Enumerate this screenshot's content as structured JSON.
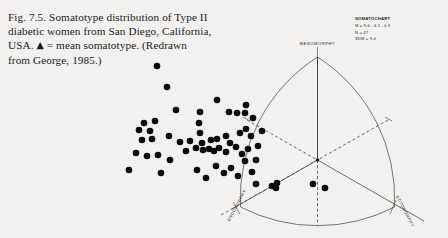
{
  "figure": {
    "caption_lines": [
      "Fig. 7.5. Somatotype distribution of Type II",
      "diabetic women from San Diego, California,",
      "USA. ▲ = mean somatotype. (Redrawn",
      "from George, 1985.)"
    ],
    "caption_full": "Fig. 7.5. Somatotype distribution of Type II diabetic women from San Diego, California, USA. ▲ = mean somatotype. (Redrawn from George, 1985.)",
    "figure_number": "Fig. 7.5.",
    "mean_marker_glyph": "▲",
    "background_color": "#f2f1ef",
    "ink_color": "#0b0b0b"
  },
  "legend": {
    "title": "SOMATOCHART",
    "lines": [
      "M = 9.6 - 6.1 - 0.9",
      "N = 47",
      "SDM = 9.0"
    ],
    "mean_somatotype": "9.6 - 6.1 - 0.9",
    "sample_size": "47",
    "sdm": "9.0"
  },
  "axes": {
    "top": "MESOMORPHY",
    "bottom_left": "ENDOMORPHY",
    "bottom_right": "ECTOMORPHY"
  },
  "chart_data": {
    "type": "scatter",
    "title": "Somatotype distribution of Type II diabetic women from San Diego, California, USA",
    "xlabel": "",
    "ylabel": "",
    "legend_position": "top-right",
    "grid": false,
    "axis_labels": [
      "ENDOMORPHY",
      "MESOMORPHY",
      "ECTOMORPHY"
    ],
    "n_points_drawn": 62,
    "mean_point": {
      "x": 317.5,
      "y": 160.0,
      "label": "mean somatotype"
    },
    "triangle": {
      "apex": {
        "x": 317.5,
        "y": 57.0
      },
      "left_corner": {
        "x": 240.0,
        "y": 207.0
      },
      "right_corner": {
        "x": 411.0,
        "y": 207.0
      },
      "center": {
        "x": 317.5,
        "y": 160.0
      }
    },
    "points": [
      {
        "x": 157,
        "y": 66
      },
      {
        "x": 167,
        "y": 87
      },
      {
        "x": 176,
        "y": 110
      },
      {
        "x": 200,
        "y": 112
      },
      {
        "x": 217,
        "y": 100
      },
      {
        "x": 229,
        "y": 112
      },
      {
        "x": 237,
        "y": 113
      },
      {
        "x": 246,
        "y": 105
      },
      {
        "x": 253,
        "y": 118
      },
      {
        "x": 155,
        "y": 121
      },
      {
        "x": 144,
        "y": 123
      },
      {
        "x": 139,
        "y": 130
      },
      {
        "x": 150,
        "y": 131
      },
      {
        "x": 152,
        "y": 139
      },
      {
        "x": 142,
        "y": 140
      },
      {
        "x": 169,
        "y": 136
      },
      {
        "x": 180,
        "y": 142
      },
      {
        "x": 190,
        "y": 141
      },
      {
        "x": 199,
        "y": 123
      },
      {
        "x": 200,
        "y": 133
      },
      {
        "x": 202,
        "y": 143
      },
      {
        "x": 211,
        "y": 140
      },
      {
        "x": 217,
        "y": 139
      },
      {
        "x": 226,
        "y": 136
      },
      {
        "x": 230,
        "y": 143
      },
      {
        "x": 240,
        "y": 133
      },
      {
        "x": 246,
        "y": 129
      },
      {
        "x": 251,
        "y": 136
      },
      {
        "x": 136,
        "y": 153
      },
      {
        "x": 147,
        "y": 156
      },
      {
        "x": 158,
        "y": 155
      },
      {
        "x": 170,
        "y": 160
      },
      {
        "x": 186,
        "y": 151
      },
      {
        "x": 196,
        "y": 148
      },
      {
        "x": 203,
        "y": 150
      },
      {
        "x": 209,
        "y": 149
      },
      {
        "x": 214,
        "y": 151
      },
      {
        "x": 219,
        "y": 148
      },
      {
        "x": 226,
        "y": 152
      },
      {
        "x": 236,
        "y": 147
      },
      {
        "x": 242,
        "y": 154
      },
      {
        "x": 248,
        "y": 149
      },
      {
        "x": 129,
        "y": 170
      },
      {
        "x": 161,
        "y": 173
      },
      {
        "x": 197,
        "y": 170
      },
      {
        "x": 206,
        "y": 178
      },
      {
        "x": 216,
        "y": 166
      },
      {
        "x": 224,
        "y": 173
      },
      {
        "x": 231,
        "y": 168
      },
      {
        "x": 238,
        "y": 176
      },
      {
        "x": 245,
        "y": 161
      },
      {
        "x": 256,
        "y": 160
      },
      {
        "x": 252,
        "y": 172
      },
      {
        "x": 258,
        "y": 146
      },
      {
        "x": 262,
        "y": 131
      },
      {
        "x": 245,
        "y": 113
      },
      {
        "x": 256,
        "y": 184
      },
      {
        "x": 272,
        "y": 186
      },
      {
        "x": 276,
        "y": 188
      },
      {
        "x": 277,
        "y": 183
      },
      {
        "x": 313,
        "y": 184
      },
      {
        "x": 325,
        "y": 188
      }
    ]
  }
}
